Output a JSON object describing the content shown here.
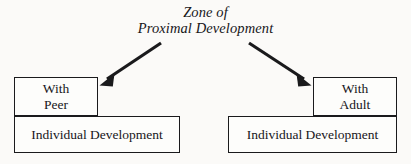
{
  "diagram": {
    "title": {
      "line1": "Zone of",
      "line2": "Proximal Development"
    },
    "boxes": {
      "with_peer": {
        "line1": "With",
        "line2": "Peer"
      },
      "with_adult": {
        "line1": "With",
        "line2": "Adult"
      },
      "individual_development_left": "Individual Development",
      "individual_development_right": "Individual Development"
    },
    "arrows": [
      {
        "name": "arrow-to-with-peer",
        "from_x": 161,
        "from_y": 43,
        "to_x": 100,
        "to_y": 85,
        "direction": "down-left"
      },
      {
        "name": "arrow-to-with-adult",
        "from_x": 249,
        "from_y": 43,
        "to_x": 311,
        "to_y": 85,
        "direction": "down-right"
      }
    ],
    "colors": {
      "background": "#fbfaf8",
      "box_fill": "#fdfdfb",
      "stroke": "#1a1a1c",
      "text": "#17161a"
    }
  }
}
